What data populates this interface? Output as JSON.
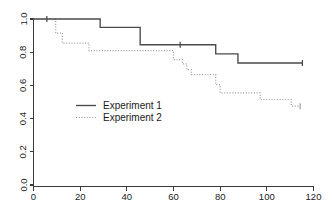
{
  "chart_data": {
    "type": "line",
    "subtype": "kaplan-meier-step",
    "title": "",
    "xlabel": "",
    "ylabel": "",
    "xlim": [
      0,
      126
    ],
    "ylim": [
      0.0,
      1.0
    ],
    "grid": false,
    "legend_position": "center-left",
    "xticks": [
      0,
      20,
      40,
      60,
      80,
      100,
      120
    ],
    "xtick_labels": [
      "0",
      "20",
      "40",
      "60",
      "80",
      "100",
      "120"
    ],
    "yticks": [
      0.0,
      0.2,
      0.4,
      0.6,
      0.8,
      1.0
    ],
    "ytick_labels": [
      "0.0",
      "0.2",
      "0.4",
      "0.6",
      "0.8",
      "1.0"
    ],
    "ytick_label_rotation": 90,
    "series": [
      {
        "name": "Experiment 1",
        "style": "solid",
        "color": "#4a4a4a",
        "x": [
          0,
          30,
          30,
          48,
          48,
          82,
          82,
          92,
          92,
          121
        ],
        "y": [
          1.0,
          1.0,
          0.95,
          0.95,
          0.845,
          0.845,
          0.79,
          0.79,
          0.735,
          0.735
        ],
        "censor_points": [
          {
            "x": 6,
            "y": 1.0
          },
          {
            "x": 66,
            "y": 0.845
          },
          {
            "x": 121,
            "y": 0.735
          }
        ]
      },
      {
        "name": "Experiment 2",
        "style": "dotted",
        "color": "#9a9a9a",
        "x": [
          0,
          10,
          10,
          13,
          13,
          25,
          25,
          63,
          63,
          67,
          67,
          69,
          69,
          71,
          71,
          82,
          82,
          84,
          84,
          102,
          102,
          116,
          116,
          120
        ],
        "y": [
          1.0,
          1.0,
          0.915,
          0.915,
          0.855,
          0.855,
          0.81,
          0.81,
          0.755,
          0.755,
          0.73,
          0.73,
          0.695,
          0.695,
          0.665,
          0.665,
          0.605,
          0.605,
          0.555,
          0.555,
          0.515,
          0.515,
          0.475,
          0.475
        ],
        "censor_points": [
          {
            "x": 120,
            "y": 0.475
          }
        ]
      }
    ]
  },
  "legend": {
    "entries": [
      {
        "label": "Experiment 1",
        "style": "solid"
      },
      {
        "label": "Experiment 2",
        "style": "dotted"
      }
    ]
  }
}
